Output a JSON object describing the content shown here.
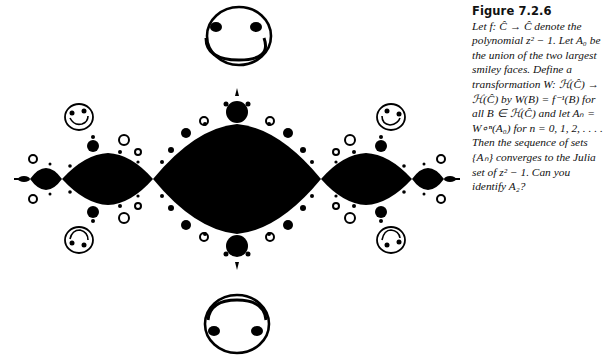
{
  "figure": {
    "label": "Figure 7.2.6",
    "elements": {
      "large_smiley_top": "upright smiley face",
      "large_smiley_bottom": "upside-down smiley face",
      "small_smileys": 4,
      "julia_set": "filled Julia set of z^2 - 1 (basilica)"
    }
  },
  "caption": {
    "title": "Figure  7.2.6",
    "text": "Let f: Ĉ → Ĉ denote the polynomial z² − 1. Let A₀ be the union of the two largest smiley faces. Define a transformation W: ℋ(Ĉ) → ℋ(Ĉ) by W(B) = f⁻¹(B) for all B ∈ ℋ(Ĉ) and let Aₙ = W∘ⁿ(A₀) for n = 0, 1, 2, . . . . Then the sequence of sets {Aₙ} converges to the Julia set of z² − 1. Can you identify A₂?"
  },
  "colors": {
    "ink": "#000000",
    "paper": "#ffffff"
  }
}
